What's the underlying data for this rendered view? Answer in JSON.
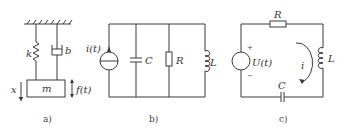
{
  "panels": {
    "a": {
      "caption": "a)",
      "labels": {
        "spring": "k",
        "damper": "b",
        "mass": "m",
        "displacement": "x",
        "force": "f(t)"
      }
    },
    "b": {
      "caption": "b)",
      "labels": {
        "source": "i(t)",
        "capacitor": "C",
        "resistor": "R",
        "inductor": "L"
      }
    },
    "c": {
      "caption": "c)",
      "labels": {
        "resistor": "R",
        "source": "U(t)",
        "plus": "+",
        "minus": "−",
        "current": "i",
        "inductor": "L",
        "capacitor": "C"
      }
    }
  }
}
